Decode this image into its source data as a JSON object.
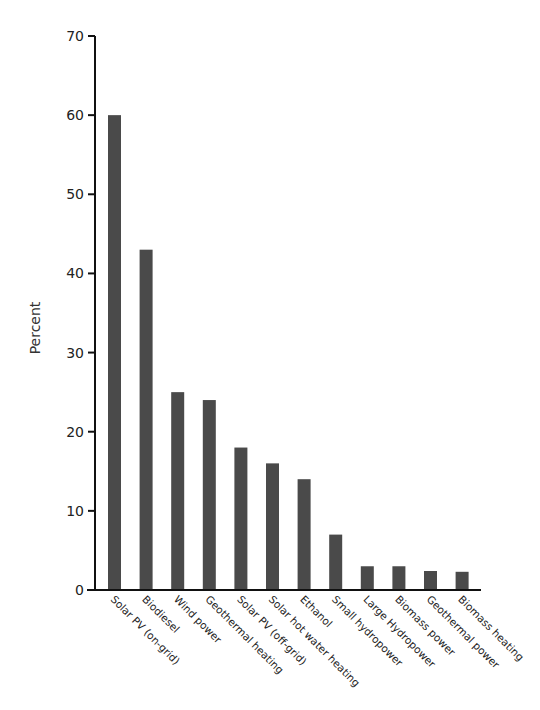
{
  "chart_data": {
    "type": "bar",
    "title": "",
    "xlabel": "",
    "ylabel": "Percent",
    "ylim": [
      0,
      70
    ],
    "yticks": [
      0,
      10,
      20,
      30,
      40,
      50,
      60,
      70
    ],
    "grid": false,
    "legend": null,
    "categories": [
      "Solar PV (on-grid)",
      "Biodiesel",
      "Wind power",
      "Geothermal heating",
      "Solar PV (off-grid)",
      "Solar hot water heating",
      "Ethanol",
      "Small hydropower",
      "Large Hydropower",
      "Biomass power",
      "Geothermal power",
      "Biomass heating"
    ],
    "values": [
      60,
      43,
      25,
      24,
      18,
      16,
      14,
      7,
      3,
      3,
      2.4,
      2.3
    ],
    "bar_color": "#4a4a4a",
    "axis_color": "#111111"
  }
}
